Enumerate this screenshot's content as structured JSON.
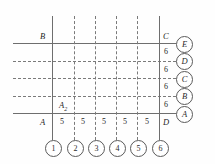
{
  "figure": {
    "type": "structural-grid-elevation",
    "corner_labels": {
      "top_left": "B",
      "top_right": "C",
      "bottom_left": "A",
      "bottom_right": "D",
      "interior": "A",
      "interior_sub": "2"
    },
    "colors": {
      "solid_line": "#6e6e6e",
      "dashed_line": "#7a7a7a",
      "bubble_stroke": "#5a5a5a",
      "text": "#1f1f1f",
      "background": "#ffffff"
    },
    "column_grid": {
      "bubbles": [
        "1",
        "2",
        "3",
        "4",
        "5",
        "6"
      ],
      "bay_dimensions": [
        "5",
        "5",
        "5",
        "5",
        "5"
      ],
      "line_styles": [
        "solid",
        "dashed",
        "dashed",
        "dashed",
        "dashed",
        "solid"
      ]
    },
    "level_grid": {
      "bubbles": [
        "E",
        "D",
        "C",
        "B",
        "A"
      ],
      "storey_dimensions": [
        "6",
        "6",
        "6",
        "6"
      ],
      "line_styles": [
        "solid",
        "dashed",
        "dashed",
        "dashed",
        "solid"
      ]
    }
  }
}
